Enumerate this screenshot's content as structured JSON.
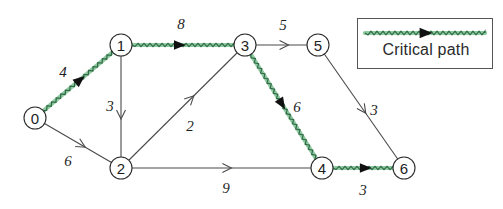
{
  "figure": {
    "type": "weighted-directed-graph",
    "title": "",
    "width": 503,
    "height": 209,
    "background_color": "#ffffff"
  },
  "colors": {
    "critical_path_green": "#8fc9a0",
    "critical_path_wave": "#2f6b46",
    "edge_gray": "#4a4a4a",
    "node_stroke": "#2b2b2b",
    "text": "#1d1d1d",
    "legend_border": "#555555"
  },
  "legend": {
    "label": "Critical path",
    "swatch_icon": "wavy-green-arrow-icon"
  },
  "graph_data": {
    "type": "graph",
    "directed": true,
    "node_radius": 11,
    "nodes": [
      {
        "id": "0",
        "label": "0",
        "x": 35,
        "y": 118
      },
      {
        "id": "1",
        "label": "1",
        "x": 121,
        "y": 45
      },
      {
        "id": "2",
        "label": "2",
        "x": 121,
        "y": 168
      },
      {
        "id": "3",
        "label": "3",
        "x": 245,
        "y": 45
      },
      {
        "id": "4",
        "label": "4",
        "x": 322,
        "y": 168
      },
      {
        "id": "5",
        "label": "5",
        "x": 318,
        "y": 45
      },
      {
        "id": "6",
        "label": "6",
        "x": 404,
        "y": 168
      }
    ],
    "edges": [
      {
        "from": "0",
        "to": "1",
        "weight": 4,
        "label_x": 63,
        "label_y": 72,
        "critical": true,
        "arrow": "solid",
        "arrow_t": 0.52
      },
      {
        "from": "0",
        "to": "2",
        "weight": 6,
        "label_x": 68,
        "label_y": 161,
        "critical": false,
        "arrow": "open",
        "arrow_t": 0.55
      },
      {
        "from": "1",
        "to": "2",
        "weight": 3,
        "label_x": 110,
        "label_y": 106,
        "critical": false,
        "arrow": "open",
        "arrow_t": 0.58
      },
      {
        "from": "1",
        "to": "3",
        "weight": 8,
        "label_x": 181,
        "label_y": 24,
        "critical": true,
        "arrow": "solid",
        "arrow_t": 0.46
      },
      {
        "from": "2",
        "to": "3",
        "weight": 2,
        "label_x": 190,
        "label_y": 126,
        "critical": false,
        "arrow": "open",
        "arrow_t": 0.57
      },
      {
        "from": "2",
        "to": "4",
        "weight": 9,
        "label_x": 226,
        "label_y": 188,
        "critical": false,
        "arrow": "open",
        "arrow_t": 0.53
      },
      {
        "from": "3",
        "to": "4",
        "weight": 6,
        "label_x": 297,
        "label_y": 107,
        "critical": true,
        "arrow": "solid",
        "arrow_t": 0.47
      },
      {
        "from": "3",
        "to": "5",
        "weight": 5,
        "label_x": 283,
        "label_y": 25,
        "critical": false,
        "arrow": "open",
        "arrow_t": 0.55
      },
      {
        "from": "5",
        "to": "6",
        "weight": 3,
        "label_x": 374,
        "label_y": 110,
        "critical": false,
        "arrow": "open",
        "arrow_t": 0.53
      },
      {
        "from": "4",
        "to": "6",
        "weight": 3,
        "label_x": 363,
        "label_y": 190,
        "critical": true,
        "arrow": "solid",
        "arrow_t": 0.53
      }
    ],
    "critical_path": [
      "0",
      "1",
      "3",
      "4",
      "6"
    ]
  }
}
